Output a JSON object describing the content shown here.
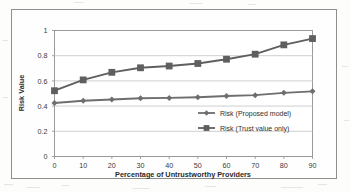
{
  "chart_data": {
    "type": "line",
    "title": "",
    "subtitle": "",
    "xlabel": "Percentage of Untrustworthy Providers",
    "ylabel": "Risk Value",
    "x": [
      0,
      10,
      20,
      30,
      40,
      50,
      60,
      70,
      80,
      90
    ],
    "xtick_labels": [
      "0",
      "10",
      "20",
      "30",
      "40",
      "50",
      "60",
      "70",
      "80",
      "90"
    ],
    "ytick_labels": [
      "0",
      "0.2",
      "0.4",
      "0.6",
      "0.8",
      "1"
    ],
    "ytick_values": [
      0,
      0.2,
      0.4,
      0.6,
      0.8,
      1
    ],
    "xlim": [
      0,
      90
    ],
    "ylim": [
      0,
      1
    ],
    "grid": "horizontal",
    "legend_position": "inside-lower-right",
    "series": [
      {
        "name": "Risk (Proposed model)",
        "marker": "diamond",
        "color": "#6e6e6e",
        "values": [
          0.425,
          0.443,
          0.452,
          0.462,
          0.465,
          0.47,
          0.48,
          0.487,
          0.505,
          0.517
        ]
      },
      {
        "name": "Risk (Trust value only)",
        "marker": "square",
        "color": "#5f5f5f",
        "values": [
          0.522,
          0.608,
          0.668,
          0.704,
          0.718,
          0.738,
          0.772,
          0.812,
          0.886,
          0.936
        ]
      }
    ]
  },
  "legend": {
    "items": [
      {
        "label": "Risk (Proposed model)",
        "marker": "diamond"
      },
      {
        "label": "Risk (Trust value only)",
        "marker": "square"
      }
    ]
  },
  "colors": {
    "series_1": "#6e6e6e",
    "series_2": "#5f5f5f",
    "gridline": "#c9c9c9",
    "axis": "#9a9a9a",
    "text": "#333333",
    "frame": "#8e8e8e"
  }
}
